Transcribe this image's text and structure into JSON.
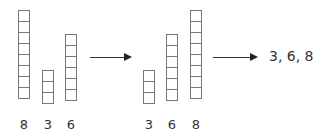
{
  "diagram": {
    "input": {
      "values": [
        8,
        3,
        6
      ],
      "labels": [
        "8",
        "3",
        "6"
      ]
    },
    "sorted": {
      "values": [
        3,
        6,
        8
      ],
      "labels": [
        "3",
        "6",
        "8"
      ]
    },
    "output_text": "3, 6, 8",
    "colors": {
      "stroke": "#777777",
      "text": "#333333",
      "arrow": "#222222"
    }
  }
}
